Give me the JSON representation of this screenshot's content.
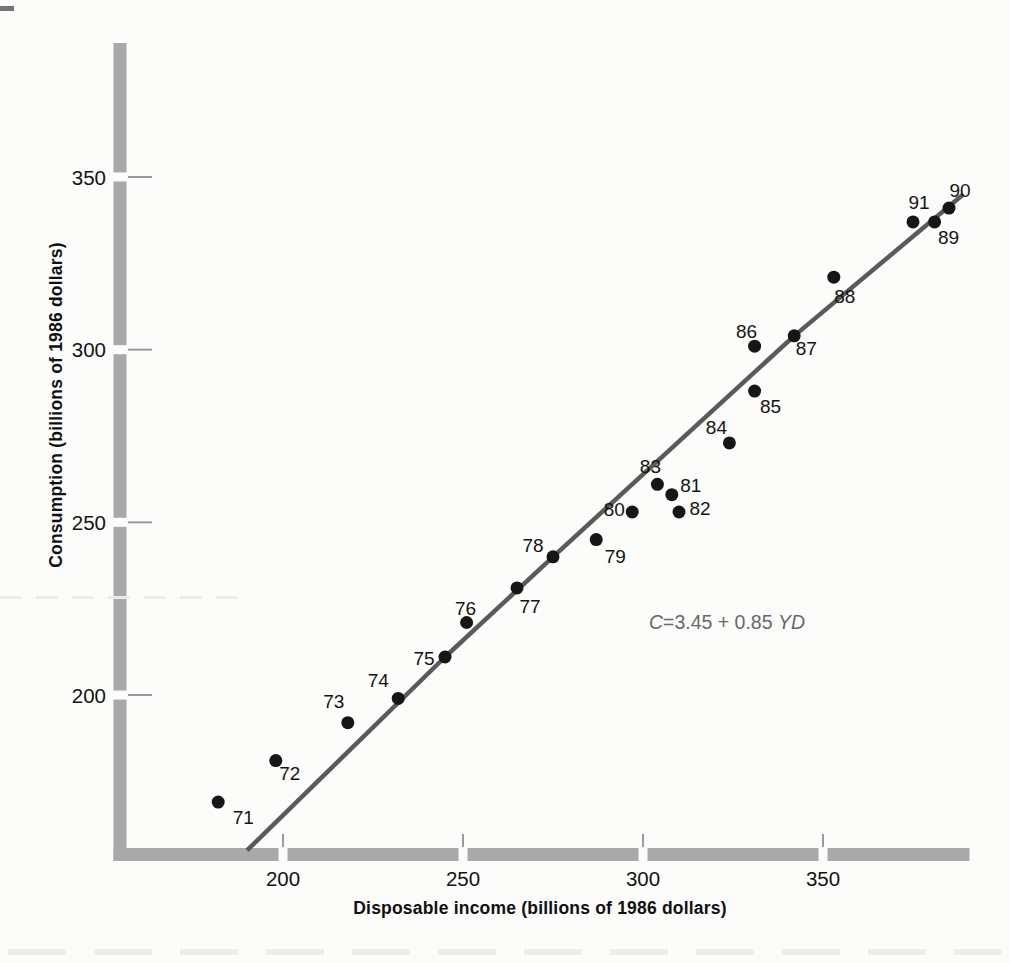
{
  "page": {
    "background": "#fcfcfa"
  },
  "chart_data": {
    "type": "scatter",
    "title": "",
    "xlabel": "Disposable income (billions of 1986 dollars)",
    "ylabel": "Consumption (billions of 1986 dollars)",
    "x_ticks": [
      200,
      250,
      300,
      350
    ],
    "y_ticks": [
      200,
      250,
      300,
      350
    ],
    "xlim": [
      153,
      391
    ],
    "ylim": [
      152,
      389
    ],
    "grid": false,
    "legend": null,
    "points": [
      {
        "label": "71",
        "x": 182,
        "y": 169,
        "label_offset": [
          25,
          15
        ]
      },
      {
        "label": "72",
        "x": 198,
        "y": 181,
        "label_offset": [
          14,
          13
        ]
      },
      {
        "label": "73",
        "x": 218,
        "y": 192,
        "label_offset": [
          -14,
          -21
        ]
      },
      {
        "label": "74",
        "x": 232,
        "y": 199,
        "label_offset": [
          -20,
          -18
        ]
      },
      {
        "label": "75",
        "x": 245,
        "y": 211,
        "label_offset": [
          -21,
          1
        ]
      },
      {
        "label": "76",
        "x": 251,
        "y": 221,
        "label_offset": [
          -1,
          -14
        ]
      },
      {
        "label": "77",
        "x": 265,
        "y": 231,
        "label_offset": [
          13,
          19
        ]
      },
      {
        "label": "78",
        "x": 275,
        "y": 240,
        "label_offset": [
          -20,
          -11
        ]
      },
      {
        "label": "79",
        "x": 287,
        "y": 245,
        "label_offset": [
          19,
          17
        ]
      },
      {
        "label": "80",
        "x": 297,
        "y": 253,
        "label_offset": [
          -18,
          -2
        ]
      },
      {
        "label": "81",
        "x": 308,
        "y": 258,
        "label_offset": [
          19,
          -9
        ]
      },
      {
        "label": "82",
        "x": 310,
        "y": 253,
        "label_offset": [
          21,
          -3
        ]
      },
      {
        "label": "83",
        "x": 304,
        "y": 261,
        "label_offset": [
          -7,
          -18
        ]
      },
      {
        "label": "84",
        "x": 324,
        "y": 273,
        "label_offset": [
          -13,
          -15
        ]
      },
      {
        "label": "85",
        "x": 331,
        "y": 288,
        "label_offset": [
          16,
          15
        ]
      },
      {
        "label": "86",
        "x": 331,
        "y": 301,
        "label_offset": [
          -8,
          -15
        ]
      },
      {
        "label": "87",
        "x": 342,
        "y": 304,
        "label_offset": [
          12,
          13
        ]
      },
      {
        "label": "88",
        "x": 353,
        "y": 321,
        "label_offset": [
          11,
          19
        ]
      },
      {
        "label": "89",
        "x": 381,
        "y": 337,
        "label_offset": [
          14,
          16
        ]
      },
      {
        "label": "90",
        "x": 385,
        "y": 341,
        "label_offset": [
          11,
          -18
        ]
      },
      {
        "label": "91",
        "x": 375,
        "y": 337,
        "label_offset": [
          6,
          -19
        ]
      }
    ],
    "trend_points": [
      [
        190,
        155
      ],
      [
        245,
        211
      ],
      [
        275,
        240
      ],
      [
        342,
        304
      ],
      [
        389,
        345
      ]
    ],
    "regression": {
      "slope": 0.85,
      "intercept": 3.45
    },
    "equation": {
      "var_left": "C",
      "body": "=3.45 + 0.85 ",
      "var_right": "YD"
    },
    "colors": {
      "axis_bar": "#a9a9a9",
      "tick": "#9b9b9b",
      "line": "#5a5a5a",
      "point": "#161616",
      "text": "#141414",
      "equation_text": "#68686a"
    }
  }
}
